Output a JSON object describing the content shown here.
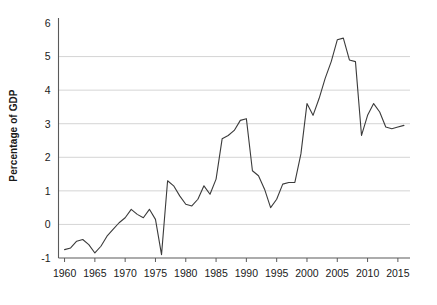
{
  "chart_data": {
    "type": "line",
    "title": "",
    "xlabel": "",
    "ylabel": "Percentage of GDP",
    "xlim": [
      1959,
      2017
    ],
    "ylim": [
      -1,
      6
    ],
    "ytick_labels": [
      "6",
      "5",
      "4",
      "3",
      "2",
      "1",
      "0",
      "-1"
    ],
    "ytick_values": [
      6,
      5,
      4,
      3,
      2,
      1,
      0,
      -1
    ],
    "xtick_labels": [
      "1960",
      "1965",
      "1970",
      "1975",
      "1980",
      "1985",
      "1990",
      "1995",
      "2000",
      "2005",
      "2010",
      "2015"
    ],
    "xtick_values": [
      1960,
      1965,
      1970,
      1975,
      1980,
      1985,
      1990,
      1995,
      2000,
      2005,
      2010,
      2015
    ],
    "grid": true,
    "grid_axis": "y",
    "legend": false,
    "line_color": "#3b3b3b",
    "grid_color": "#c9c9c9",
    "axis_color": "#5a5a5a",
    "x": [
      1960,
      1961,
      1962,
      1963,
      1964,
      1965,
      1966,
      1967,
      1968,
      1969,
      1970,
      1971,
      1972,
      1973,
      1974,
      1975,
      1976,
      1977,
      1978,
      1979,
      1980,
      1981,
      1982,
      1983,
      1984,
      1985,
      1986,
      1987,
      1988,
      1989,
      1990,
      1991,
      1992,
      1993,
      1994,
      1995,
      1996,
      1997,
      1998,
      1999,
      2000,
      2001,
      2002,
      2003,
      2004,
      2005,
      2006,
      2007,
      2008,
      2009,
      2010,
      2011,
      2012,
      2013,
      2014,
      2015,
      2016
    ],
    "values": [
      -0.75,
      -0.7,
      -0.5,
      -0.45,
      -0.6,
      -0.85,
      -0.65,
      -0.35,
      -0.15,
      0.05,
      0.2,
      0.45,
      0.3,
      0.2,
      0.45,
      0.15,
      -0.9,
      1.3,
      1.15,
      0.85,
      0.6,
      0.55,
      0.75,
      1.15,
      0.9,
      1.35,
      2.55,
      2.65,
      2.8,
      3.1,
      3.15,
      1.6,
      1.45,
      1.05,
      0.5,
      0.75,
      1.2,
      1.25,
      1.25,
      2.1,
      3.6,
      3.25,
      3.75,
      4.35,
      4.85,
      5.5,
      5.55,
      4.9,
      4.85,
      2.65,
      3.25,
      3.6,
      3.35,
      2.9,
      2.85,
      2.9,
      2.95
    ]
  }
}
